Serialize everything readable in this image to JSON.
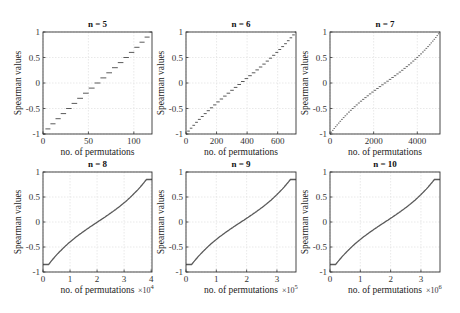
{
  "chart_data": [
    {
      "type": "line",
      "title": "n = 5",
      "xlabel": "no. of permutations",
      "ylabel": "Spearman values",
      "xlim": [
        0,
        120
      ],
      "ylim": [
        -1,
        1
      ],
      "xticks": [
        0,
        50,
        100
      ],
      "xticklabels": [
        "0",
        "50",
        "100"
      ],
      "yticks": [
        -1,
        -0.5,
        0,
        0.5,
        1
      ],
      "yticklabels": [
        "-1",
        "-0.5",
        "0",
        "0.5",
        "1"
      ],
      "x_multiplier": "",
      "grid": true,
      "style": "staircase",
      "n": 5,
      "total": 120
    },
    {
      "type": "line",
      "title": "n = 6",
      "xlabel": "no. of permutations",
      "ylabel": "Spearman values",
      "xlim": [
        0,
        720
      ],
      "ylim": [
        -1,
        1
      ],
      "xticks": [
        0,
        200,
        400,
        600
      ],
      "xticklabels": [
        "0",
        "200",
        "400",
        "600"
      ],
      "yticks": [
        -1,
        -0.5,
        0,
        0.5,
        1
      ],
      "yticklabels": [
        "-1",
        "-0.5",
        "0",
        "0.5",
        "1"
      ],
      "x_multiplier": "",
      "grid": true,
      "style": "staircase",
      "n": 6,
      "total": 720
    },
    {
      "type": "line",
      "title": "n = 7",
      "xlabel": "no. of permutations",
      "ylabel": "Spearman values",
      "xlim": [
        0,
        5040
      ],
      "ylim": [
        -1,
        1
      ],
      "xticks": [
        0,
        2000,
        4000
      ],
      "xticklabels": [
        "0",
        "2000",
        "4000"
      ],
      "yticks": [
        -1,
        -0.5,
        0,
        0.5,
        1
      ],
      "yticklabels": [
        "-1",
        "-0.5",
        "0",
        "0.5",
        "1"
      ],
      "x_multiplier": "",
      "grid": true,
      "style": "fine-staircase",
      "n": 7,
      "total": 5040
    },
    {
      "type": "line",
      "title": "n = 8",
      "xlabel": "no. of permutations",
      "ylabel": "Spearman values",
      "xlim": [
        0,
        40320
      ],
      "ylim": [
        -1,
        1
      ],
      "xticks": [
        0,
        10000,
        20000,
        30000,
        40000
      ],
      "xticklabels": [
        "0",
        "1",
        "2",
        "3",
        "4"
      ],
      "yticks": [
        -1,
        -0.5,
        0,
        0.5,
        1
      ],
      "yticklabels": [
        "-1",
        "-0.5",
        "0",
        "0.5",
        "1"
      ],
      "x_multiplier": "×10^4",
      "grid": true,
      "style": "smooth",
      "n": 8,
      "total": 40320
    },
    {
      "type": "line",
      "title": "n = 9",
      "xlabel": "no. of permutations",
      "ylabel": "Spearman values",
      "xlim": [
        0,
        362880
      ],
      "ylim": [
        -1,
        1
      ],
      "xticks": [
        0,
        100000,
        200000,
        300000
      ],
      "xticklabels": [
        "0",
        "1",
        "2",
        "3"
      ],
      "yticks": [
        -1,
        -0.5,
        0,
        0.5,
        1
      ],
      "yticklabels": [
        "-1",
        "-0.5",
        "0",
        "0.5",
        "1"
      ],
      "x_multiplier": "×10^5",
      "grid": true,
      "style": "smooth",
      "n": 9,
      "total": 362880
    },
    {
      "type": "line",
      "title": "n = 10",
      "xlabel": "no. of permutations",
      "ylabel": "Spearman values",
      "xlim": [
        0,
        3628800
      ],
      "ylim": [
        -1,
        1
      ],
      "xticks": [
        0,
        1000000,
        2000000,
        3000000
      ],
      "xticklabels": [
        "0",
        "1",
        "2",
        "3"
      ],
      "yticks": [
        -1,
        -0.5,
        0,
        0.5,
        1
      ],
      "yticklabels": [
        "-1",
        "-0.5",
        "0",
        "0.5",
        "1"
      ],
      "x_multiplier": "×10^6",
      "grid": true,
      "style": "smooth",
      "n": 10,
      "total": 3628800
    }
  ],
  "colors": {
    "line": "#5a5a5a",
    "axis": "#333333",
    "grid": "#e3e3e3"
  }
}
